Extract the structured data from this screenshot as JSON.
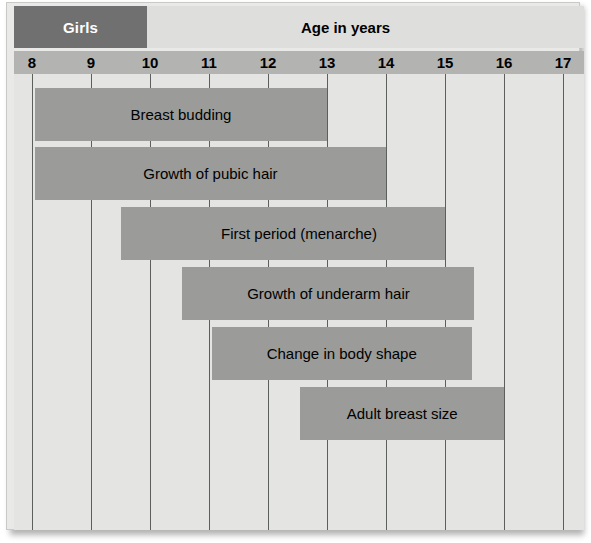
{
  "header": {
    "group_label": "Girls",
    "title": "Age in years"
  },
  "chart_data": {
    "type": "bar",
    "orientation": "horizontal",
    "title": "Age in years",
    "subtitle": "Girls",
    "xlabel": "Age in years",
    "ylabel": "",
    "xlim": [
      8,
      17
    ],
    "grid": true,
    "legend": false,
    "tick_labels": [
      "8",
      "9",
      "10",
      "11",
      "12",
      "13",
      "14",
      "15",
      "16",
      "17"
    ],
    "ticks": [
      8,
      9,
      10,
      11,
      12,
      13,
      14,
      15,
      16,
      17
    ],
    "categories": [
      "Breast budding",
      "Growth of pubic hair",
      "Growth spurt",
      "Peak",
      "First period (menarche)",
      "Growth of underarm hair",
      "Change in body shape",
      "Adult breast size"
    ],
    "bars": [
      {
        "label": "Breast budding",
        "start": 8.05,
        "end": 13.0,
        "row": 0,
        "style": "light"
      },
      {
        "label": "Growth of pubic hair",
        "start": 8.05,
        "end": 14.0,
        "row": 1,
        "style": "light"
      },
      {
        "label": "Growth spurt",
        "start": 9.5,
        "end": 14.45,
        "row": 2,
        "style": "light"
      },
      {
        "label": "Peak",
        "start": 11.0,
        "end": 13.65,
        "row": 2,
        "style": "dark"
      },
      {
        "label": "First period (menarche)",
        "start": 10.05,
        "end": 15.0,
        "row": 3,
        "style": "light"
      },
      {
        "label": "Growth of underarm hair",
        "start": 10.55,
        "end": 15.5,
        "row": 4,
        "style": "light"
      },
      {
        "label": "Change in body shape",
        "start": 11.05,
        "end": 15.45,
        "row": 5,
        "style": "light"
      },
      {
        "label": "Adult breast size",
        "start": 12.55,
        "end": 16.0,
        "row": 6,
        "style": "light"
      }
    ],
    "colors": {
      "bar_light": "#9b9c99",
      "bar_dark": "#6f7170",
      "plot_background": "#e4e5e2",
      "axis_band": "#b3b4b1",
      "header_band": "#dedfdc",
      "group_band": "#707070",
      "gridline": "#5d5f5c"
    }
  }
}
